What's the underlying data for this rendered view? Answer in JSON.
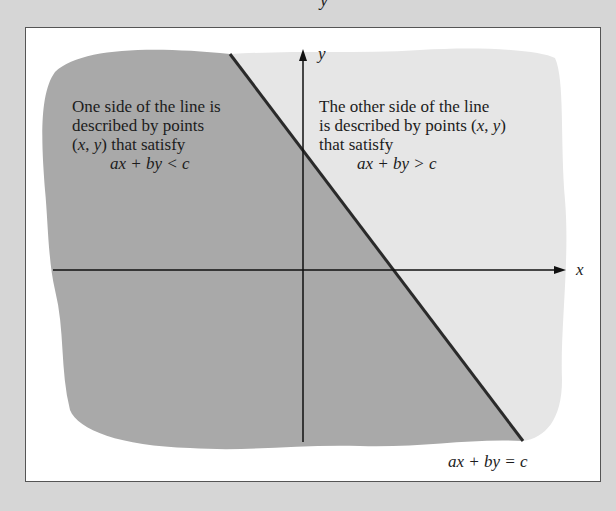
{
  "figure": {
    "top_clipped_glyph": "y",
    "left_region": {
      "line1": "One side of the line is",
      "line2": "described by points",
      "line3_prefix": "(",
      "line3_x": "x",
      "line3_sep": ", ",
      "line3_y": "y",
      "line3_suffix": ") that satisfy",
      "inequality": "ax + by < c"
    },
    "right_region": {
      "line1": "The other side of the line",
      "line2_prefix": "is described by points (",
      "line2_x": "x",
      "line2_sep": ", ",
      "line2_y": "y",
      "line2_suffix": ")",
      "line3": "that satisfy",
      "inequality": "ax + by > c"
    },
    "axes": {
      "x_label": "x",
      "y_label": "y"
    },
    "line_equation": "ax + by = c",
    "colors": {
      "background": "#d6d6d6",
      "frame": "#ffffff",
      "dark_region": "#a9a9a9",
      "light_region": "#e6e6e6",
      "line": "#2a2a2a",
      "axes": "#111111"
    }
  }
}
